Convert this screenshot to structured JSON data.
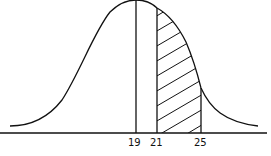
{
  "diagram": {
    "type": "normal-distribution-curve",
    "mean_label": "19",
    "shaded_region": {
      "from": "21",
      "to": "25",
      "pattern": "diagonal-hatch"
    },
    "x_labels": [
      {
        "text": "19",
        "x": 133
      },
      {
        "text": "21",
        "x": 155
      },
      {
        "text": "25",
        "x": 200
      }
    ],
    "colors": {
      "line": "#111111",
      "background": "#ffffff"
    }
  }
}
